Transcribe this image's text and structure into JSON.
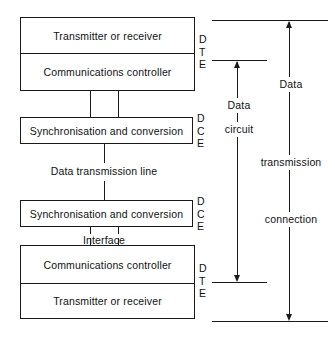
{
  "diagram": {
    "line_color": "#1a1a1a",
    "background_color": "#ffffff",
    "blocks": [
      {
        "id": "dte-top",
        "side_label": "D T E",
        "cells": [
          {
            "id": "dte-top-upper",
            "label": "Transmitter or receiver"
          },
          {
            "id": "dte-top-lower",
            "label": "Communications controller"
          }
        ]
      },
      {
        "id": "dce-top",
        "side_label": "D C E",
        "cells": [
          {
            "id": "dce-top-cell",
            "label": "Synchronisation and conversion"
          }
        ]
      },
      {
        "id": "dce-bottom",
        "side_label": "D C E",
        "cells": [
          {
            "id": "dce-bottom-cell",
            "label": "Synchronisation and conversion"
          }
        ]
      },
      {
        "id": "dte-bottom",
        "side_label": "D T E",
        "cells": [
          {
            "id": "dte-bottom-upper",
            "label": "Communications controller"
          },
          {
            "id": "dte-bottom-lower",
            "label": "Transmitter or receiver"
          }
        ]
      }
    ],
    "side_labels": {
      "dte_top": "D\nT\nE",
      "dce_top": "D\nC\nE",
      "dce_bottom": "D\nC\nE",
      "dte_bottom": "D\nT\nE"
    },
    "connector_labels": {
      "transmission_line": "Data transmission line",
      "interface": "Interface"
    },
    "brackets": [
      {
        "id": "data-circuit-bracket",
        "label_lines": [
          "Data",
          "circuit"
        ]
      },
      {
        "id": "data-transmission-connection-bracket",
        "label_lines": [
          "Data",
          "transmission",
          "connection"
        ]
      }
    ]
  }
}
